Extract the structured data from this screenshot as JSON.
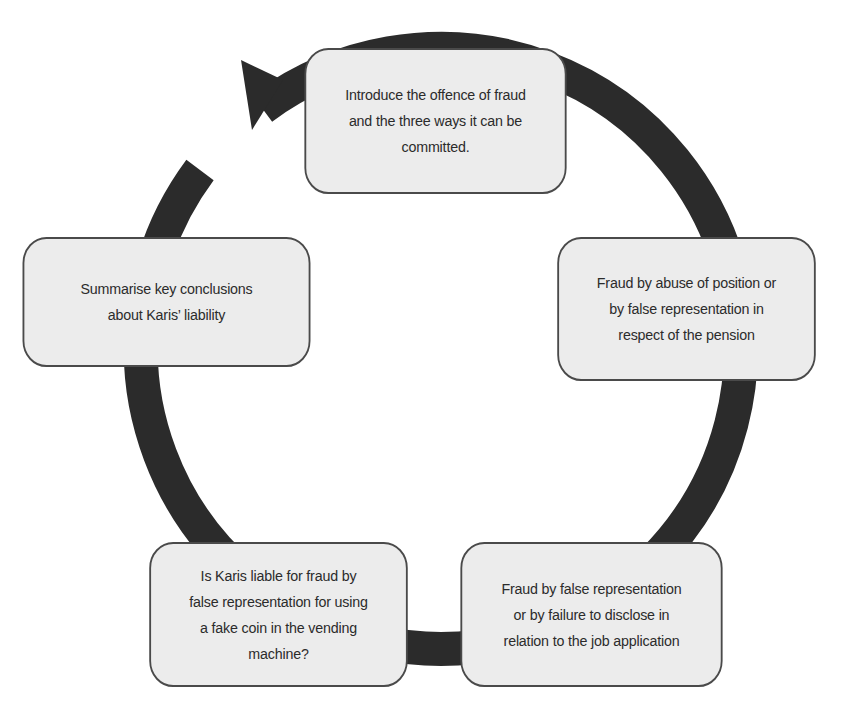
{
  "diagram": {
    "type": "cycle",
    "colors": {
      "ring": "#2b2b2b",
      "box_fill": "#ececec",
      "box_border": "#4a4a4a",
      "text": "#2b2b2b",
      "background": "#ffffff"
    },
    "steps": [
      {
        "id": 1,
        "text": "Introduce the offence of fraud\nand the three ways it can be\ncommitted."
      },
      {
        "id": 2,
        "text": "Fraud by abuse of position or\nby false representation in\nrespect of the pension"
      },
      {
        "id": 3,
        "text": "Fraud by false representation\nor by failure to disclose in\nrelation to the job application"
      },
      {
        "id": 4,
        "text": "Is Karis liable for fraud by\nfalse representation for using\na fake coin in the vending\nmachine?"
      },
      {
        "id": 5,
        "text": "Summarise key conclusions\nabout Karis’ liability"
      }
    ],
    "arrow": {
      "direction": "clockwise",
      "head_position": "before-step-1",
      "icon": "arrowhead-icon"
    }
  }
}
